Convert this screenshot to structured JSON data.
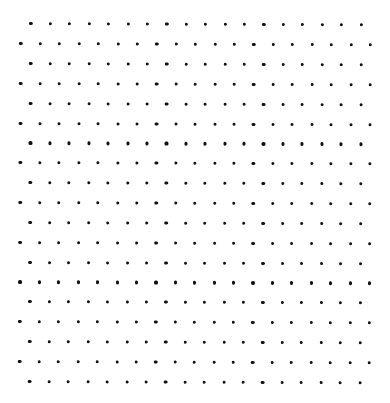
{
  "pattern": {
    "type": "staggered-dot-grid",
    "rows": 19,
    "offset_row_count": 18,
    "normal_row_count": 19,
    "start_x_offset_row": 31,
    "start_x_normal_row": 21,
    "start_y": 23.8,
    "step_x": 19.42,
    "step_y": 19.86,
    "dot_diameter": 3.2,
    "dot_color": "#111111",
    "background": "#ffffff"
  }
}
